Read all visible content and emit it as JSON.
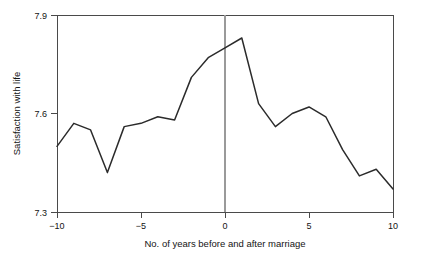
{
  "chart_data": {
    "type": "line",
    "title": "",
    "xlabel": "No. of years before and after marriage",
    "ylabel": "Satisfaction with life",
    "xlim": [
      -10,
      10
    ],
    "ylim": [
      7.3,
      7.9
    ],
    "xticks": [
      -10,
      -5,
      0,
      5,
      10
    ],
    "xtick_labels": [
      "−10",
      "−5",
      "0",
      "5",
      "10"
    ],
    "yticks": [
      7.3,
      7.6,
      7.9
    ],
    "ytick_labels": [
      "7.3",
      "7.6",
      "7.9"
    ],
    "grid": false,
    "legend": null,
    "annotations": [
      {
        "name": "marriage-reference-line",
        "type": "vline",
        "x": 0,
        "color": "#9a9a9a"
      }
    ],
    "x": [
      -10,
      -9,
      -8,
      -7,
      -6,
      -5,
      -4,
      -3,
      -2,
      -1,
      0,
      1,
      2,
      3,
      4,
      5,
      6,
      7,
      8,
      9,
      10
    ],
    "values": [
      7.5,
      7.57,
      7.55,
      7.42,
      7.56,
      7.57,
      7.59,
      7.58,
      7.71,
      7.77,
      7.8,
      7.83,
      7.63,
      7.56,
      7.6,
      7.62,
      7.59,
      7.49,
      7.41,
      7.43,
      7.37
    ],
    "series": [
      {
        "name": "Satisfaction with life",
        "color": "#2b2b2b",
        "values": [
          7.5,
          7.57,
          7.55,
          7.42,
          7.56,
          7.57,
          7.59,
          7.58,
          7.71,
          7.77,
          7.8,
          7.83,
          7.63,
          7.56,
          7.6,
          7.62,
          7.59,
          7.49,
          7.41,
          7.43,
          7.37
        ]
      }
    ]
  },
  "axes": {
    "x_title": "No. of years before and after marriage",
    "y_title": "Satisfaction with life",
    "x_tick_labels": [
      "−10",
      "−5",
      "0",
      "5",
      "10"
    ],
    "y_tick_labels": [
      "7.9",
      "7.6",
      "7.3"
    ]
  },
  "colors": {
    "line": "#2b2b2b",
    "axis": "#4a4a4a",
    "reference": "#9a9a9a",
    "background": "#ffffff"
  }
}
